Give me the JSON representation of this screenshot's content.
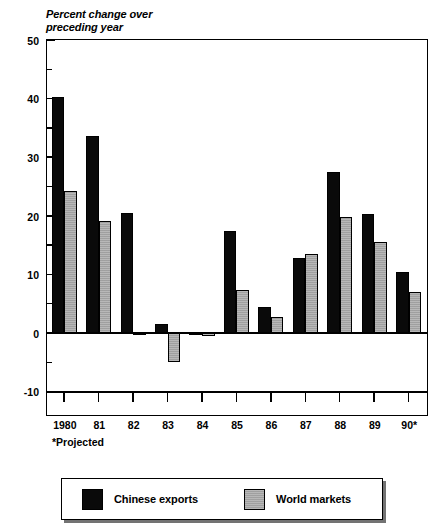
{
  "chart_data": {
    "type": "bar",
    "title": "Percent change over\npreceding year",
    "xlabel": "",
    "ylabel": "Percent change over preceding year",
    "categories": [
      "1980",
      "81",
      "82",
      "83",
      "84",
      "85",
      "86",
      "87",
      "88",
      "89",
      "90*"
    ],
    "series": [
      {
        "name": "Chinese exports",
        "color": "#0a0a0a",
        "values": [
          40.2,
          33.7,
          20.5,
          1.5,
          0.1,
          17.4,
          4.5,
          12.8,
          27.5,
          20.3,
          10.5
        ]
      },
      {
        "name": "World markets",
        "color": "#a8a8a8",
        "values": [
          24.3,
          19.2,
          -0.3,
          -5.0,
          -0.4,
          7.3,
          2.7,
          13.5,
          19.8,
          15.6,
          7.0
        ]
      }
    ],
    "ylim": [
      -10,
      50
    ],
    "ytick_major": [
      -10,
      0,
      10,
      20,
      30,
      40,
      50
    ],
    "ytick_minor": [
      -5,
      5,
      15,
      25,
      35,
      45
    ],
    "ytick_labels": [
      "-10",
      "0",
      "10",
      "20",
      "30",
      "40",
      "50"
    ],
    "grid": false,
    "legend_position": "bottom",
    "footnote": "*Projected"
  },
  "legend": {
    "entries": [
      {
        "label": "Chinese exports"
      },
      {
        "label": "World markets"
      }
    ]
  }
}
